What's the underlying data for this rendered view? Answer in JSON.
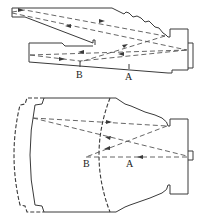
{
  "figure": {
    "top_diagram": {
      "labels": {
        "point_b": "B",
        "point_a": "A"
      }
    },
    "bottom_diagram": {
      "labels": {
        "point_b": "B",
        "point_a": "A"
      }
    }
  },
  "colors": {
    "line": "#3a3a3a",
    "ray": "#555555",
    "background": "#ffffff"
  }
}
